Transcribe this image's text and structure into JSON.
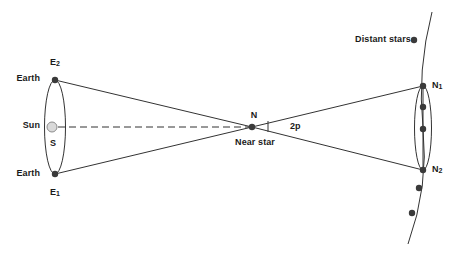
{
  "diagram": {
    "colors": {
      "stroke": "#333333",
      "dot": "#3a3a3a",
      "sun_fill": "#d9d9d9",
      "sun_stroke": "#8c8c8c",
      "text": "#1a1a1a",
      "background": "#ffffff"
    },
    "labels": {
      "earth_top": "Earth",
      "earth_bottom": "Earth",
      "sun": "Sun",
      "sun_symbol": "S",
      "e2": "E",
      "e2_sub": "2",
      "e1": "E",
      "e1_sub": "1",
      "near_star_point": "N",
      "near_star": "Near star",
      "angle": "2p",
      "distant_stars": "Distant stars",
      "n1": "N",
      "n1_sub": "1",
      "n2": "N",
      "n2_sub": "2"
    },
    "geometry": {
      "earth_orbit_ellipse": {
        "cx": 55,
        "cy": 127,
        "rx": 10.5,
        "ry": 47
      },
      "distant_ellipse": {
        "cx": 423,
        "cy": 128,
        "rx": 8.5,
        "ry": 42
      },
      "sun": {
        "cx": 52,
        "cy": 127,
        "r": 5
      },
      "e2_point": {
        "x": 55,
        "y": 80
      },
      "e1_point": {
        "x": 55,
        "y": 174
      },
      "near_star_point": {
        "x": 252,
        "y": 127
      },
      "n1_point": {
        "x": 423,
        "y": 86
      },
      "n2_point": {
        "x": 423,
        "y": 170
      },
      "angle_tick": {
        "x": 268,
        "y1": 121,
        "y2": 132
      },
      "inner_dots": [
        {
          "cx": 423,
          "cy": 107
        },
        {
          "cx": 423,
          "cy": 129
        }
      ],
      "distant_star_dots": [
        {
          "cx": 414,
          "cy": 40
        },
        {
          "cx": 423,
          "cy": 86
        },
        {
          "cx": 423,
          "cy": 170
        },
        {
          "cx": 419,
          "cy": 188
        },
        {
          "cx": 412,
          "cy": 213
        }
      ]
    }
  }
}
